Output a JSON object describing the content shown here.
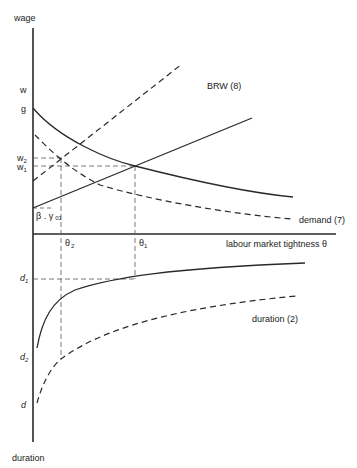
{
  "diagram": {
    "axes": {
      "y_top_label": "wage",
      "y_bottom_label": "duration",
      "x_label": "labour market tightness",
      "x_symbol": "θ"
    },
    "wage_ticks": {
      "w": "w",
      "g": "g",
      "w2": "w",
      "w2_sub": "2",
      "w1": "w",
      "w1_sub": "1",
      "beta_gamma": "β . γ",
      "beta_gamma_sub": "01"
    },
    "theta_ticks": {
      "theta2": "θ",
      "theta2_sub": "2",
      "theta1": "θ",
      "theta1_sub": "1"
    },
    "duration_ticks": {
      "d1": "d",
      "d1_sub": "1",
      "d2": "d",
      "d2_sub": "2",
      "d": "d"
    },
    "curve_labels": {
      "brw": "BRW (8)",
      "demand": "demand (7)",
      "duration": "duration (2)"
    },
    "colors": {
      "line": "#2a2a2a",
      "guide": "#555555",
      "background": "#ffffff"
    }
  }
}
